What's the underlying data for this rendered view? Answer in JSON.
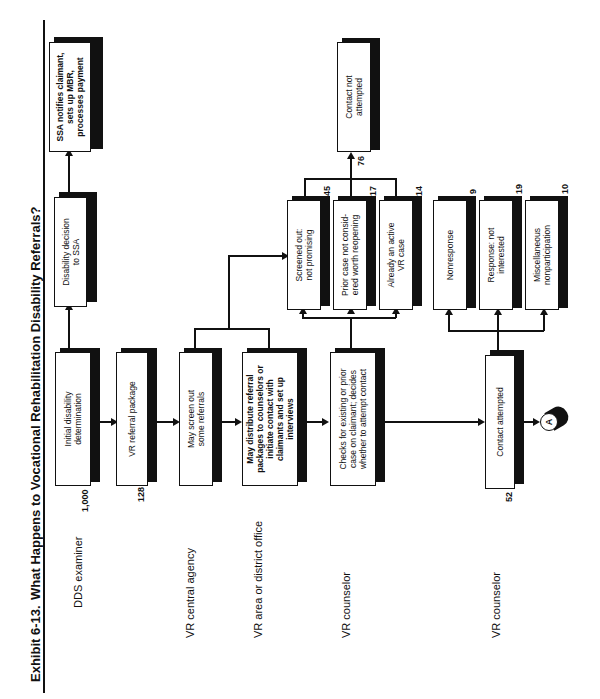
{
  "exhibit": {
    "label": "Exhibit 6-13.",
    "title": "What Happens to Vocational Rehabilitation Disability Referrals?"
  },
  "rows": [
    {
      "label": "DDS examiner"
    },
    {
      "label": "VR central agency"
    },
    {
      "label": "VR area or district office"
    },
    {
      "label": "VR counselor"
    },
    {
      "label": "VR counselor"
    }
  ],
  "boxes": {
    "initial_determination": {
      "text": "Initial disability\ndetermination",
      "count": "1,000"
    },
    "decision_to_ssa": {
      "text": "Disability decision\nto SSA"
    },
    "ssa_notifies": {
      "text": "SSA notifies claimant,\nsets up MBR,\nprocesses payment"
    },
    "vr_referral_package": {
      "text": "VR referral package",
      "count": "128"
    },
    "may_screen_out": {
      "text": "May screen out\nsome referrals"
    },
    "may_distribute": {
      "text": "May distribute referral\npackages to counselors or\ninitiate contact with\nclaimants and set up\ninterviews"
    },
    "checks_existing": {
      "text": "Checks for existing or prior\ncase on claimant; decides\nwhether to attempt contact"
    },
    "screened_out": {
      "text": "Screened out:\nnot promising",
      "count": "45"
    },
    "prior_case": {
      "text": "Prior case not consid-\nered worth reopening",
      "count": "17"
    },
    "already_active": {
      "text": "Already an active\nVR case",
      "count": "14"
    },
    "contact_not_attempted": {
      "text": "Contact not\nattempted",
      "count": "76"
    },
    "contact_attempted": {
      "text": "Contact attempted",
      "count": "52"
    },
    "nonresponse": {
      "text": "Nonresponse",
      "count": "9"
    },
    "response_not_interested": {
      "text": "Response: not\ninterested",
      "count": "19"
    },
    "misc_nonparticipation": {
      "text": "Miscellaneous\nnonparticipation",
      "count": "10"
    }
  },
  "connector": {
    "label": "A"
  }
}
